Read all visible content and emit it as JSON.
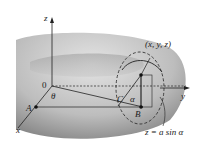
{
  "diagram": {
    "labels": {
      "z_axis": "z",
      "y_axis": "y",
      "x_axis": "x",
      "origin": "0",
      "theta": "θ",
      "point_a": "A",
      "point_b": "B",
      "point_c": "C",
      "alpha": "α",
      "point_xyz": "(x, y, z)",
      "equation": "z = a sin α"
    },
    "colors": {
      "torus_light": "#d4d4d4",
      "torus_dark": "#7a7a7a",
      "line": "#222222"
    }
  }
}
